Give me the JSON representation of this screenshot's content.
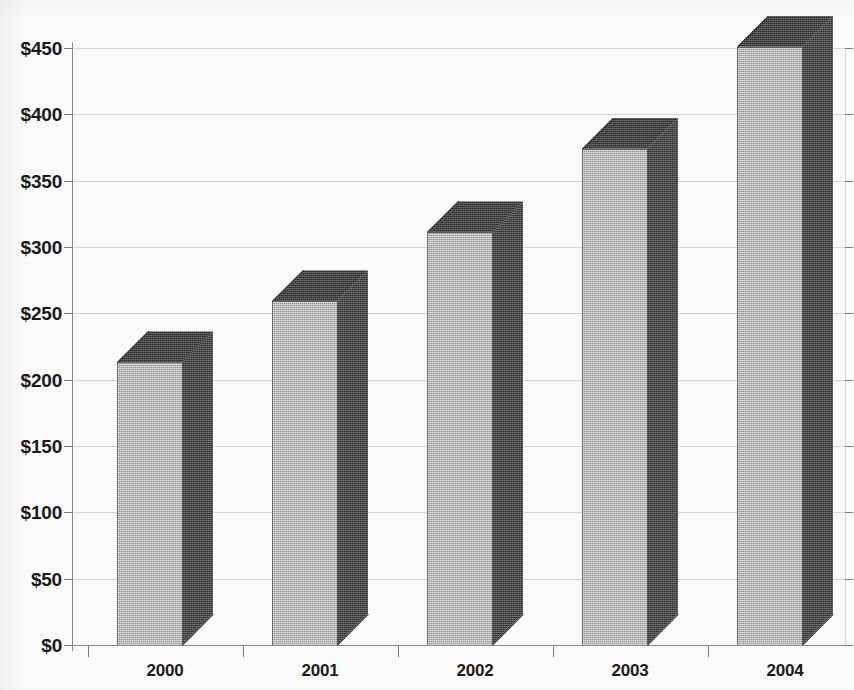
{
  "chart_data": {
    "type": "bar",
    "render_style": "3d-column",
    "title": "",
    "subtitle": "",
    "xlabel": "",
    "ylabel": "",
    "categories": [
      "2000",
      "2001",
      "2002",
      "2003",
      "2004"
    ],
    "values": [
      213,
      259,
      311,
      374,
      451
    ],
    "series": [
      {
        "name": "",
        "values": [
          213,
          259,
          311,
          374,
          451
        ]
      }
    ],
    "ylim": [
      0,
      450
    ],
    "ytick_values": [
      0,
      50,
      100,
      150,
      200,
      250,
      300,
      350,
      400,
      450
    ],
    "ytick_labels": [
      "$0",
      "$50",
      "$100",
      "$150",
      "$200",
      "$250",
      "$300",
      "$350",
      "$400",
      "$450"
    ],
    "xtick_labels": [
      "2000",
      "2001",
      "2002",
      "2003",
      "2004"
    ],
    "value_prefix": "$",
    "grid": true,
    "grid_axis": "y",
    "legend": false,
    "legend_position": "none",
    "annotations": [],
    "colors": {
      "bar_front": "#b9b9b9",
      "bar_side": "#454545",
      "bar_top": "#3f3f3f",
      "bar_outline": "#2f2f2f",
      "gridline": "#d6d6d6",
      "axis": "#8d8d8d",
      "text": "#1b1b1b",
      "background": "#fdfdfd"
    }
  },
  "geometry": {
    "plot_left": 72,
    "plot_top": 48,
    "plot_width": 773,
    "plot_height": 597,
    "baseline_y": 645,
    "depth_x": 31,
    "depth_y": 31,
    "bar_width": 65,
    "bar_slot_width": 155,
    "first_bar_left": 117
  }
}
